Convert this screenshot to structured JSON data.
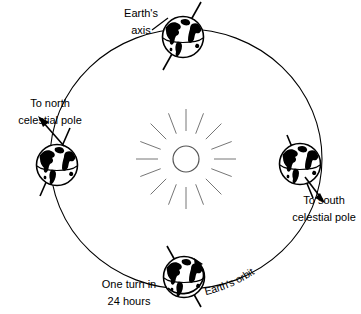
{
  "diagram": {
    "colors": {
      "stroke": "#000000",
      "background": "#ffffff",
      "sun_ray": "#666666",
      "land": "#000000"
    },
    "labels": {
      "earths_axis": "Earth's\naxis",
      "earths_axis_line1": "Earth's",
      "earths_axis_line2": "axis",
      "to_north_celestial_pole_line1": "To north",
      "to_north_celestial_pole_line2": "celestial pole",
      "to_south_celestial_pole_line1": "To south",
      "to_south_celestial_pole_line2": "celestial pole",
      "one_turn_line1": "One turn in",
      "one_turn_line2": "24 hours",
      "earths_orbit": "Earth's orbit"
    },
    "elements": {
      "sun_name": "sun",
      "sun_ray_count": 16,
      "orbit_name": "earth-orbit-ellipse",
      "globe_top": "earth-globe-top",
      "globe_left": "earth-globe-left",
      "globe_right": "earth-globe-right",
      "globe_bottom": "earth-globe-bottom"
    },
    "geometry": {
      "orbit_center_x": 186,
      "orbit_center_y": 159,
      "orbit_radius_x": 136,
      "orbit_radius_y": 130,
      "globe_radius": 21,
      "axis_tilt_degrees": 23.5
    }
  }
}
